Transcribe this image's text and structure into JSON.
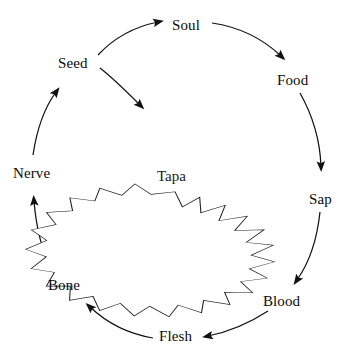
{
  "diagram": {
    "type": "cycle",
    "center": {
      "label": "Tapa",
      "shape": "star-burst",
      "points": 16,
      "x": 175,
      "y": 182
    },
    "nodes": [
      {
        "id": "seed",
        "label": "Seed",
        "x": 78,
        "y": 63,
        "anchor": "center"
      },
      {
        "id": "soul",
        "label": "Soul",
        "x": 190,
        "y": 25,
        "anchor": "center"
      },
      {
        "id": "food",
        "label": "Food",
        "x": 295,
        "y": 80,
        "anchor": "center"
      },
      {
        "id": "sap",
        "label": "Sap",
        "x": 322,
        "y": 199,
        "anchor": "center"
      },
      {
        "id": "blood",
        "label": "Blood",
        "x": 286,
        "y": 301,
        "anchor": "center"
      },
      {
        "id": "flesh",
        "label": "Flesh",
        "x": 179,
        "y": 336,
        "anchor": "center"
      },
      {
        "id": "bone",
        "label": "Bone",
        "x": 67,
        "y": 285,
        "anchor": "center"
      },
      {
        "id": "nerve",
        "label": "Nerve",
        "x": 36,
        "y": 173,
        "anchor": "center"
      }
    ],
    "edges": [
      {
        "id": "seed-soul",
        "from": "Seed",
        "to": "Soul",
        "direction": "clockwise"
      },
      {
        "id": "soul-food",
        "from": "Soul",
        "to": "Food",
        "direction": "clockwise"
      },
      {
        "id": "food-sap",
        "from": "Food",
        "to": "Sap",
        "direction": "clockwise"
      },
      {
        "id": "sap-blood",
        "from": "Sap",
        "to": "Blood",
        "direction": "clockwise"
      },
      {
        "id": "blood-flesh",
        "from": "Blood",
        "to": "Flesh",
        "direction": "clockwise"
      },
      {
        "id": "flesh-bone",
        "from": "Flesh",
        "to": "Bone",
        "direction": "clockwise"
      },
      {
        "id": "bone-nerve",
        "from": "Bone",
        "to": "Nerve",
        "direction": "clockwise"
      },
      {
        "id": "nerve-seed",
        "from": "Nerve",
        "to": "Seed",
        "direction": "clockwise"
      },
      {
        "id": "seed-tapa",
        "from": "Seed",
        "to": "Tapa",
        "direction": "inward"
      }
    ],
    "colors": {
      "stroke": "#111111",
      "text": "#0b0b0b",
      "background": "#ffffff"
    }
  }
}
